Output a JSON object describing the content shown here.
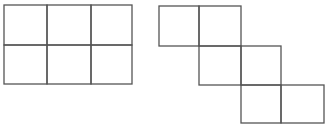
{
  "diagram": {
    "title": "",
    "stroke_color": "#555555",
    "background": "#ffffff",
    "figures": [
      {
        "name": "rectangle-grid-2x3",
        "rows": 2,
        "cols": 3,
        "cells": [
          {
            "x": 4,
            "y": 5,
            "w": 43,
            "h": 40
          },
          {
            "x": 47,
            "y": 5,
            "w": 44,
            "h": 40
          },
          {
            "x": 91,
            "y": 5,
            "w": 41,
            "h": 40
          },
          {
            "x": 4,
            "y": 45,
            "w": 43,
            "h": 39
          },
          {
            "x": 47,
            "y": 45,
            "w": 44,
            "h": 39
          },
          {
            "x": 91,
            "y": 45,
            "w": 41,
            "h": 39
          }
        ]
      },
      {
        "name": "staircase-net-6-squares",
        "cells": [
          {
            "x": 159,
            "y": 6,
            "w": 40,
            "h": 40
          },
          {
            "x": 199,
            "y": 6,
            "w": 42,
            "h": 40
          },
          {
            "x": 199,
            "y": 46,
            "w": 42,
            "h": 39
          },
          {
            "x": 241,
            "y": 46,
            "w": 40,
            "h": 39
          },
          {
            "x": 241,
            "y": 85,
            "w": 40,
            "h": 38
          },
          {
            "x": 281,
            "y": 85,
            "w": 43,
            "h": 38
          }
        ]
      }
    ]
  }
}
